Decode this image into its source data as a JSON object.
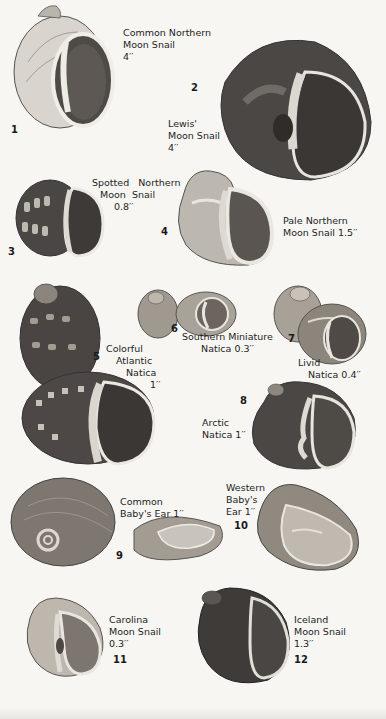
{
  "plate": {
    "specimens": [
      {
        "number": "1",
        "name_lines": [
          "Common Northern",
          "Moon Snail"
        ],
        "size": "4′′"
      },
      {
        "number": "2",
        "name_lines": [
          "Lewis'",
          "Moon Snail"
        ],
        "size": "4′′"
      },
      {
        "number": "3",
        "name_lines": [
          "Spotted   Northern",
          "Moon  Snail"
        ],
        "size": "0.8′′"
      },
      {
        "number": "4",
        "name_lines": [
          "Pale Northern",
          "Moon Snail 1.5′′"
        ],
        "size": ""
      },
      {
        "number": "5",
        "name_lines": [
          "Colorful",
          "Atlantic",
          "Natica"
        ],
        "size": "1′′"
      },
      {
        "number": "6",
        "name_lines": [
          "Southern Miniature",
          "Natica 0.3′′"
        ],
        "size": ""
      },
      {
        "number": "7",
        "name_lines": [
          "Livid",
          "Natica 0.4′′"
        ],
        "size": ""
      },
      {
        "number": "8",
        "name_lines": [
          "Arctic",
          "Natica 1′′"
        ],
        "size": ""
      },
      {
        "number": "9",
        "name_lines": [
          "Common",
          "Baby's Ear 1′′"
        ],
        "size": ""
      },
      {
        "number": "10",
        "name_lines": [
          "Western",
          "Baby's",
          "Ear 1′′"
        ],
        "size": ""
      },
      {
        "number": "11",
        "name_lines": [
          "Carolina",
          "Moon Snail"
        ],
        "size": "0.3′′"
      },
      {
        "number": "12",
        "name_lines": [
          "Iceland",
          "Moon Snail"
        ],
        "size": "1.3′′"
      }
    ]
  },
  "colors": {
    "background": "#f7f6f3",
    "shell_light": "#cfcac2",
    "shell_mid": "#8a847c",
    "shell_dark": "#3d3a37",
    "aperture": "#57524d",
    "lip": "#e8e5df"
  }
}
